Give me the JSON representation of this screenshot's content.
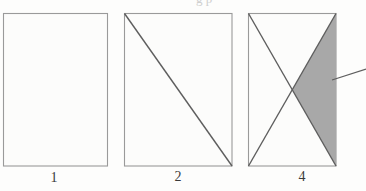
{
  "figure": {
    "name": "rectangle-subdivision-figure",
    "background_color": "#fdfdfc",
    "stroke_color": "#6b6b6b",
    "border_color": "#9a9a9a",
    "shade_color": "#a8a8a8",
    "label_color": "#3a3a3a",
    "cut_text_fragment": "g p",
    "panels": [
      {
        "label": "1",
        "diagonals": "none",
        "shaded": false,
        "x": 3,
        "y": 13,
        "width": 104,
        "height": 153
      },
      {
        "label": "2",
        "diagonals": "one",
        "shaded": false,
        "x": 124,
        "y": 13,
        "width": 108,
        "height": 153
      },
      {
        "label": "4",
        "diagonals": "both",
        "shaded": true,
        "shaded_region": "right-triangle",
        "x": 248,
        "y": 13,
        "width": 88,
        "height": 153,
        "leader_line": {
          "x1": 332,
          "y1": 80,
          "x2": 366,
          "y2": 69
        }
      }
    ]
  }
}
